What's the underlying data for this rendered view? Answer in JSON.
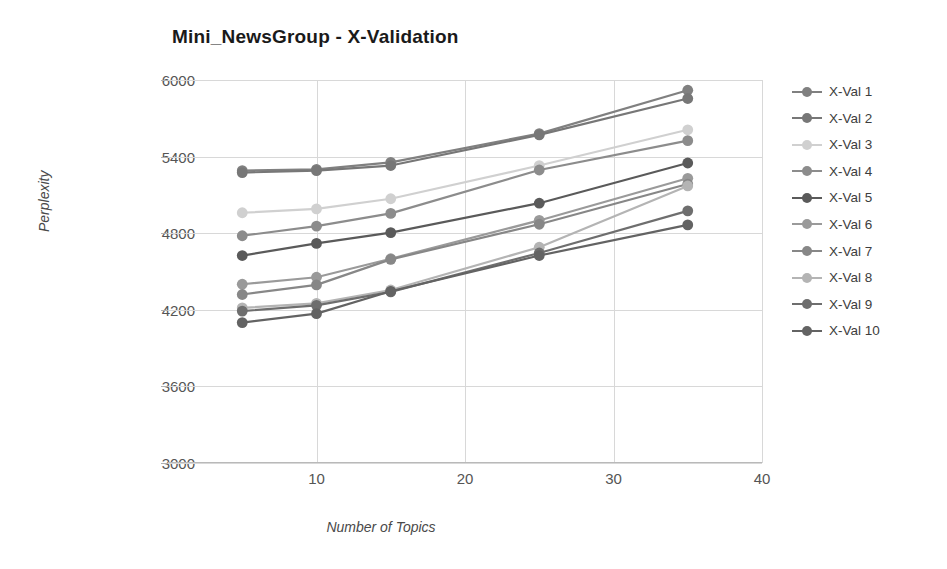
{
  "chart_data": {
    "type": "line",
    "title": "Mini_NewsGroup - X-Validation",
    "xlabel": "Number of Topics",
    "ylabel": "Perplexity",
    "x": [
      5,
      10,
      15,
      25,
      35
    ],
    "xlim": [
      0,
      40
    ],
    "ylim": [
      3000,
      6000
    ],
    "xticks": [
      10,
      20,
      30,
      40
    ],
    "yticks": [
      3000,
      3600,
      4200,
      4800,
      5400,
      6000
    ],
    "grid": true,
    "legend_position": "right",
    "marker": "circle",
    "series": [
      {
        "name": "X-Val 1",
        "color": "#808080",
        "values": [
          5290,
          5300,
          5355,
          5580,
          5920
        ]
      },
      {
        "name": "X-Val 2",
        "color": "#777777",
        "values": [
          5275,
          5290,
          5330,
          5570,
          5855
        ]
      },
      {
        "name": "X-Val 3",
        "color": "#d0d0d0",
        "values": [
          4960,
          4990,
          5070,
          5330,
          5610
        ]
      },
      {
        "name": "X-Val 4",
        "color": "#8c8c8c",
        "values": [
          4780,
          4855,
          4955,
          5295,
          5525
        ]
      },
      {
        "name": "X-Val 5",
        "color": "#5a5a5a",
        "values": [
          4625,
          4720,
          4805,
          5035,
          5350
        ]
      },
      {
        "name": "X-Val 6",
        "color": "#9a9a9a",
        "values": [
          4400,
          4455,
          4600,
          4900,
          5230
        ]
      },
      {
        "name": "X-Val 7",
        "color": "#878787",
        "values": [
          4320,
          4395,
          4595,
          4870,
          5185
        ]
      },
      {
        "name": "X-Val 8",
        "color": "#b4b4b4",
        "values": [
          4215,
          4250,
          4355,
          4690,
          5170
        ]
      },
      {
        "name": "X-Val 9",
        "color": "#6e6e6e",
        "values": [
          4190,
          4235,
          4340,
          4645,
          4975
        ]
      },
      {
        "name": "X-Val 10",
        "color": "#636363",
        "values": [
          4100,
          4170,
          4345,
          4625,
          4865
        ]
      }
    ]
  },
  "legend": {
    "items": [
      {
        "label": "X-Val 1"
      },
      {
        "label": "X-Val 2"
      },
      {
        "label": "X-Val 3"
      },
      {
        "label": "X-Val 4"
      },
      {
        "label": "X-Val 5"
      },
      {
        "label": "X-Val 6"
      },
      {
        "label": "X-Val 7"
      },
      {
        "label": "X-Val 8"
      },
      {
        "label": "X-Val 9"
      },
      {
        "label": "X-Val 10"
      }
    ]
  },
  "style": {
    "grid_color": "#d8d8d8",
    "axis_color": "#b9b9b9",
    "text_color": "#555555",
    "title_color": "#1a1a1a",
    "background": "#ffffff"
  }
}
